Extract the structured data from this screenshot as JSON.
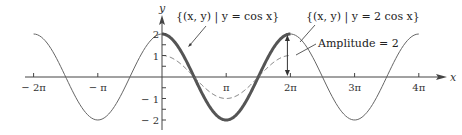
{
  "chart_data": {
    "type": "line",
    "title": "",
    "xlabel": "x",
    "ylabel": "y",
    "xlim_pi": [
      -2.35,
      4.35
    ],
    "ylim": [
      -2.4,
      2.6
    ],
    "grid": false,
    "x_ticks": [
      {
        "value_pi": -2,
        "label": "− 2π"
      },
      {
        "value_pi": -1,
        "label": "− π"
      },
      {
        "value_pi": 1,
        "label": "π"
      },
      {
        "value_pi": 2,
        "label": "2π"
      },
      {
        "value_pi": 3,
        "label": "3π"
      },
      {
        "value_pi": 4,
        "label": "4π"
      }
    ],
    "y_ticks": [
      {
        "value": 2,
        "label": "2"
      },
      {
        "value": 1,
        "label": "1"
      },
      {
        "value": -1,
        "label": "− 1"
      },
      {
        "value": -2,
        "label": "− 2"
      }
    ],
    "series": [
      {
        "name": "y = 2 cos x",
        "expression": "2cos(x)",
        "x_range_pi": [
          -2,
          4
        ],
        "style": "thin-solid",
        "color": "#666666"
      },
      {
        "name": "y = 2 cos x (one period highlighted)",
        "expression": "2cos(x)",
        "x_range_pi": [
          0,
          2
        ],
        "style": "thick-solid",
        "color": "#555555"
      },
      {
        "name": "y = cos x",
        "expression": "cos(x)",
        "x_range_pi": [
          0,
          2
        ],
        "style": "dashed",
        "color": "#777777"
      }
    ],
    "annotations": [
      {
        "id": "cos",
        "text": "{(x, y) | y = cos x}"
      },
      {
        "id": "twocos",
        "text": "{(x, y) | y = 2 cos x}"
      },
      {
        "id": "amplitude",
        "text": "Amplitude = 2"
      }
    ]
  }
}
